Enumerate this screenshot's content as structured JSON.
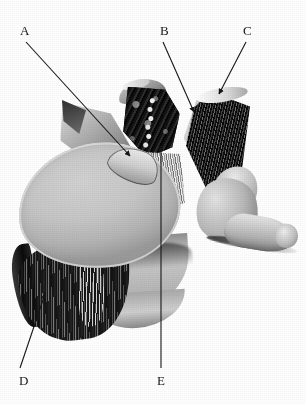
{
  "figure": {
    "kind": "anatomical-photograph",
    "rendering": "grayscale halftone photograph on white background",
    "canvas": {
      "width": 306,
      "height": 404
    },
    "background_color": "#ffffff",
    "ink_color": "#161616"
  },
  "labels": [
    {
      "id": "A",
      "text": "A",
      "x": 20,
      "y": 24,
      "leader": {
        "type": "arrow",
        "x1": 26,
        "y1": 42,
        "x2": 130,
        "y2": 156,
        "arrowhead_at": "end"
      }
    },
    {
      "id": "B",
      "text": "B",
      "x": 160,
      "y": 24,
      "leader": {
        "type": "arrow",
        "x1": 163,
        "y1": 42,
        "x2": 194,
        "y2": 112,
        "arrowhead_at": "end"
      }
    },
    {
      "id": "C",
      "text": "C",
      "x": 243,
      "y": 24,
      "leader": {
        "type": "arrow",
        "x1": 246,
        "y1": 42,
        "x2": 219,
        "y2": 94,
        "arrowhead_at": "end"
      }
    },
    {
      "id": "D",
      "text": "D",
      "x": 19,
      "y": 374,
      "leader": {
        "type": "arrow",
        "x1": 20,
        "y1": 368,
        "x2": 45,
        "y2": 294,
        "arrowhead_at": "end"
      }
    },
    {
      "id": "E",
      "text": "E",
      "x": 157,
      "y": 374,
      "leader": {
        "type": "arrow",
        "x1": 161,
        "y1": 368,
        "x2": 161,
        "y2": 146,
        "arrowhead_at": "end"
      }
    }
  ],
  "anatomy_parts": [
    {
      "name": "vertebral-body-superior-surface",
      "tone": "#c6c6c6"
    },
    {
      "name": "annulus-fibrosus-striations",
      "tone": "#111111"
    },
    {
      "name": "vertebral-canal-cancellous-bone",
      "tone": "#151515"
    },
    {
      "name": "ligament-fibre-band-centre",
      "tone": "#c9c9c9"
    },
    {
      "name": "ligament-flap-right",
      "tone": "#0f0f0f"
    },
    {
      "name": "superior-articular-process-right",
      "tone": "#bdbdbd"
    },
    {
      "name": "transverse-process-right",
      "tone": "#cdcdcd"
    },
    {
      "name": "pedicle-left-wedge",
      "tone": "#b6b6b6"
    }
  ]
}
